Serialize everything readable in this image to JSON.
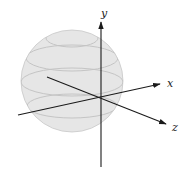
{
  "diagram": {
    "type": "3d-coordinate-axes-with-sphere",
    "axes": {
      "x": {
        "label": "x"
      },
      "y": {
        "label": "y"
      },
      "z": {
        "label": "z"
      }
    },
    "sphere": {
      "fill": "#e6e6e6",
      "stroke": "#b8b8b8",
      "latitude_bands": 4
    },
    "colors": {
      "axis": "#1a1a1a",
      "sphere_fill": "#e6e6e6",
      "sphere_band": "#c4c4c4"
    }
  }
}
